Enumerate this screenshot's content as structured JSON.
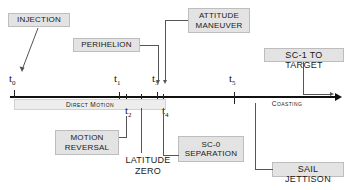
{
  "diagram": {
    "axis": {
      "direction": "left-to-right",
      "phases": [
        {
          "id": "direct-motion",
          "label": "Direct Motion",
          "style": "small-caps"
        },
        {
          "id": "coasting",
          "label": "Coasting",
          "style": "small-caps"
        }
      ],
      "time_markers": [
        {
          "id": "t0",
          "label": "t",
          "sub": "0",
          "position": "above"
        },
        {
          "id": "t1",
          "label": "t",
          "sub": "1",
          "position": "above"
        },
        {
          "id": "t2",
          "label": "t",
          "sub": "2",
          "position": "below"
        },
        {
          "id": "t3",
          "label": "t",
          "sub": "3",
          "position": "above"
        },
        {
          "id": "t4",
          "label": "t",
          "sub": "4",
          "position": "below"
        },
        {
          "id": "t5",
          "label": "t",
          "sub": "5",
          "position": "above"
        }
      ]
    },
    "events": [
      {
        "id": "injection",
        "label": "INJECTION",
        "style": "caps",
        "marker": "t0",
        "side": "above"
      },
      {
        "id": "perihelion",
        "label": "PERIHELION",
        "style": "caps",
        "marker": "t1",
        "side": "above"
      },
      {
        "id": "attitude-maneuver",
        "label": "ATTITUDE\nMANEUVER",
        "style": "caps",
        "marker": "t3",
        "side": "above"
      },
      {
        "id": "sc1-to-target",
        "label": "SC-1 TO TARGET",
        "style": "small-caps",
        "marker": "end",
        "side": "above"
      },
      {
        "id": "motion-reversal",
        "label": "MOTION\nREVERSAL",
        "style": "caps",
        "marker": "t2",
        "side": "below"
      },
      {
        "id": "latitude-zero",
        "label": "LATITUDE\nZERO",
        "style": "small-caps",
        "marker": "t3",
        "side": "below"
      },
      {
        "id": "sc0-separation",
        "label": "SC-0\nSEPARATION",
        "style": "caps",
        "marker": "t4",
        "side": "below"
      },
      {
        "id": "sail-jettison",
        "label": "SAIL JETTISON",
        "style": "small-caps",
        "marker": "t5",
        "side": "below"
      }
    ],
    "colors": {
      "label_fill": "#e3e3e3",
      "label_border": "#bdbdbd",
      "axis": "#111111",
      "connector": "#555555",
      "phase_band": "#ededed"
    }
  }
}
